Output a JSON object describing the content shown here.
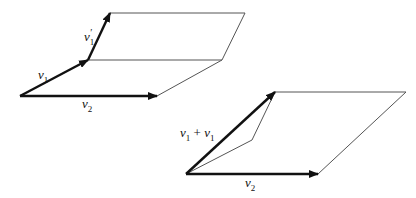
{
  "diagram": {
    "figure_left": {
      "labels": {
        "v1": {
          "base": "v",
          "sub": "1",
          "prime": ""
        },
        "v1_prime": {
          "base": "v",
          "sub": "1",
          "prime": "′"
        },
        "v2": {
          "base": "v",
          "sub": "2",
          "prime": ""
        }
      },
      "description": "Two parallelograms sharing edge v1 end; v1 and v2 spanning lower, v1' and v2 spanning upper"
    },
    "figure_right": {
      "labels": {
        "sum": {
          "a": "v",
          "a_sub": "1",
          "op": " + ",
          "b": "v",
          "b_sub": "1"
        },
        "v2": {
          "base": "v",
          "sub": "2"
        }
      },
      "description": "Parallelogram spanned by sum vector and v2, with thin lines showing component vectors"
    },
    "colors": {
      "arrow": "#111111",
      "edge": "#555555",
      "background": "#ffffff"
    }
  }
}
